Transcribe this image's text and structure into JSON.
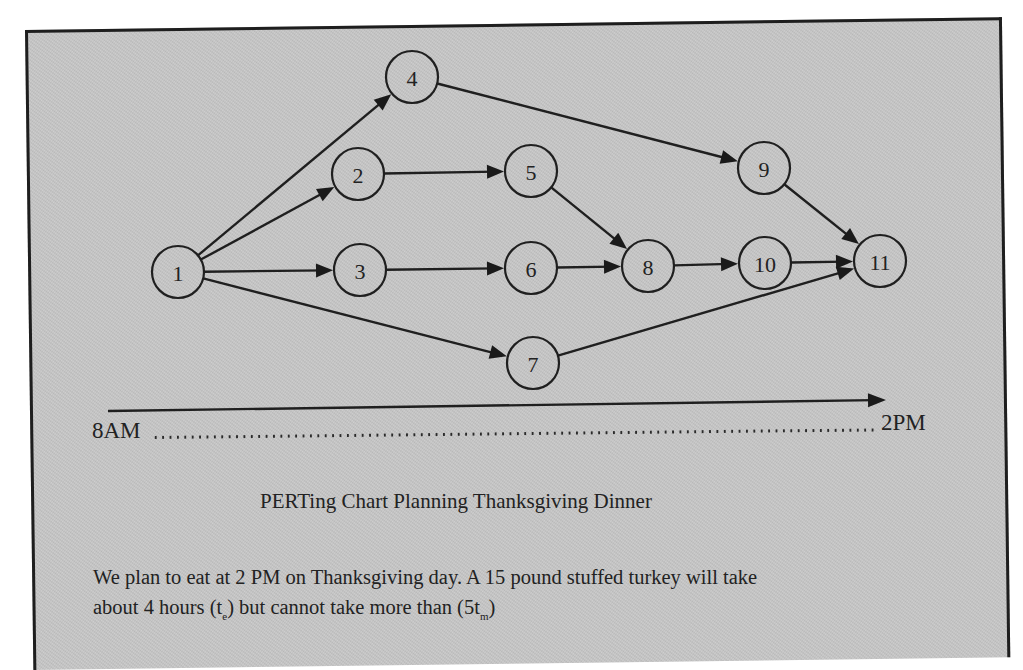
{
  "chart_data": {
    "type": "network",
    "title": "PERTing Chart Planning Thanksgiving Dinner",
    "timeline": {
      "start_label": "8AM",
      "end_label": "2PM",
      "direction": "left-to-right"
    },
    "nodes": [
      {
        "id": "1",
        "label": "1",
        "x": 178,
        "y": 272
      },
      {
        "id": "2",
        "label": "2",
        "x": 358,
        "y": 174
      },
      {
        "id": "3",
        "label": "3",
        "x": 360,
        "y": 270
      },
      {
        "id": "4",
        "label": "4",
        "x": 412,
        "y": 77
      },
      {
        "id": "5",
        "label": "5",
        "x": 531,
        "y": 171
      },
      {
        "id": "6",
        "label": "6",
        "x": 531,
        "y": 268
      },
      {
        "id": "7",
        "label": "7",
        "x": 533,
        "y": 363
      },
      {
        "id": "8",
        "label": "8",
        "x": 648,
        "y": 266
      },
      {
        "id": "9",
        "label": "9",
        "x": 764,
        "y": 168
      },
      {
        "id": "10",
        "label": "10",
        "x": 765,
        "y": 263
      },
      {
        "id": "11",
        "label": "11",
        "x": 880,
        "y": 261
      }
    ],
    "edges": [
      {
        "from": "1",
        "to": "4"
      },
      {
        "from": "1",
        "to": "2"
      },
      {
        "from": "1",
        "to": "3"
      },
      {
        "from": "1",
        "to": "7"
      },
      {
        "from": "2",
        "to": "5"
      },
      {
        "from": "3",
        "to": "6"
      },
      {
        "from": "4",
        "to": "9"
      },
      {
        "from": "5",
        "to": "8"
      },
      {
        "from": "6",
        "to": "8"
      },
      {
        "from": "7",
        "to": "11"
      },
      {
        "from": "8",
        "to": "10"
      },
      {
        "from": "9",
        "to": "11"
      },
      {
        "from": "10",
        "to": "11"
      }
    ],
    "node_radius": 26
  },
  "timeline": {
    "start_label": "8AM",
    "end_label": "2PM",
    "arrow": {
      "x1": 108,
      "y1": 411,
      "x2": 886,
      "y2": 400
    }
  },
  "caption": {
    "title": "PERTing Chart Planning Thanksgiving Dinner",
    "line1": "We plan to eat at 2 PM on Thanksgiving day. A 15 pound stuffed turkey will take",
    "line2_pre": "about 4 hours (t",
    "line2_sub1": "e",
    "line2_mid": ") but cannot take more than (5t",
    "line2_sub2": "m",
    "line2_post": ")"
  },
  "colors": {
    "background": "#c9c9c9",
    "ink": "#1f1f1f",
    "frame": "#1e1e1e"
  }
}
